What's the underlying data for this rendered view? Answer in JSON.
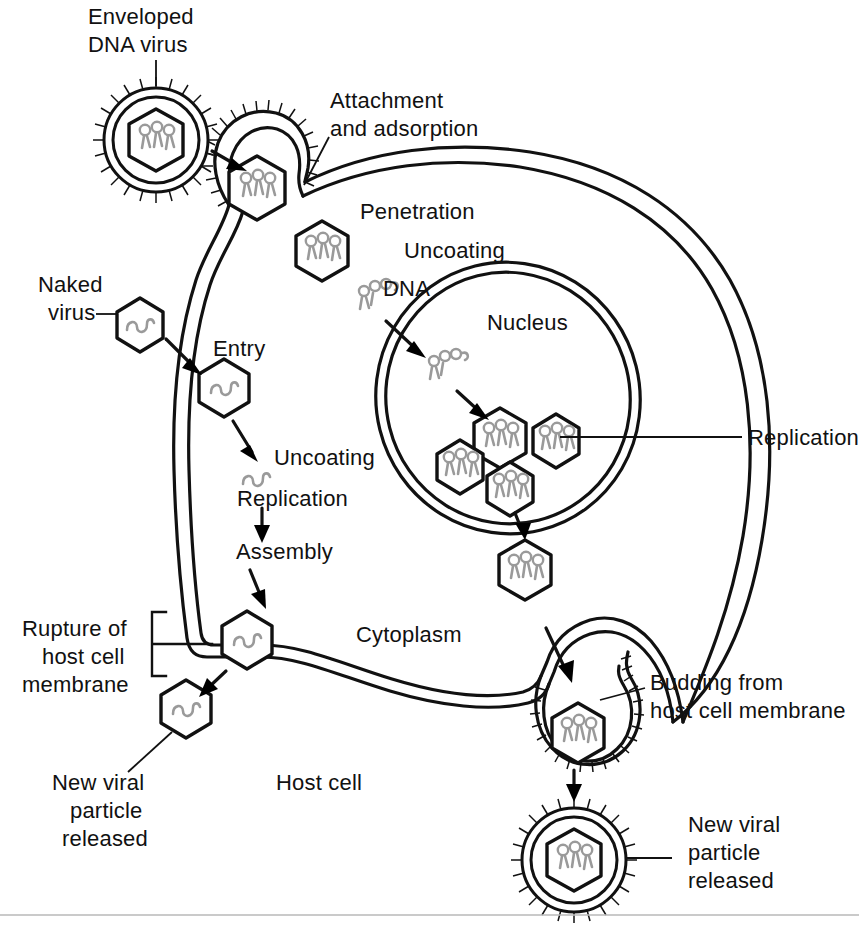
{
  "figure": {
    "background_color": "#ffffff",
    "ink_color": "#111111",
    "nucleic_acid_color": "#9a9a9a",
    "footer_rule_color": "#b8b8b8"
  },
  "labels": {
    "enveloped_virus_line1": "Enveloped",
    "enveloped_virus_line2": "DNA virus",
    "attachment_line1": "Attachment",
    "attachment_line2": "and adsorption",
    "penetration": "Penetration",
    "uncoating_top": "Uncoating",
    "dna": "DNA",
    "nucleus": "Nucleus",
    "replication_right": "Replication",
    "naked_virus_line1": "Naked",
    "naked_virus_line2": "virus",
    "entry": "Entry",
    "uncoating_left": "Uncoating",
    "replication_left": "Replication",
    "assembly": "Assembly",
    "rupture_line1": "Rupture of",
    "rupture_line2": "host cell",
    "rupture_line3": "membrane",
    "new_viral_left_line1": "New viral",
    "new_viral_left_line2": "particle",
    "new_viral_left_line3": "released",
    "cytoplasm": "Cytoplasm",
    "host_cell": "Host cell",
    "budding_line1": "Budding from",
    "budding_line2": "host cell membrane",
    "new_viral_right_line1": "New viral",
    "new_viral_right_line2": "particle",
    "new_viral_right_line3": "released"
  },
  "icons": {
    "enveloped_virion": "enveloped-virion-icon",
    "naked_virion": "naked-virion-icon",
    "dna_strand": "dna-strand-icon",
    "rna_squiggle": "rna-squiggle-icon",
    "arrow": "arrow-icon",
    "bracket": "bracket-icon",
    "leader_line": "leader-line-icon"
  },
  "diagram_elements": {
    "enveloped_virions": [
      {
        "name": "free-enveloped-virus",
        "cx": 156,
        "cy": 140,
        "r": 52
      },
      {
        "name": "released-enveloped-virus",
        "cx": 574,
        "cy": 860,
        "r": 52
      }
    ],
    "naked_capsids": [
      {
        "name": "naked-virus-free",
        "cx": 140,
        "cy": 325
      },
      {
        "name": "naked-virus-entered",
        "cx": 224,
        "cy": 388
      },
      {
        "name": "naked-virus-assembled",
        "cx": 247,
        "cy": 640
      },
      {
        "name": "naked-virus-released",
        "cx": 186,
        "cy": 709
      }
    ],
    "dna_capsids": [
      {
        "name": "capsid-attachment",
        "cx": 251,
        "cy": 188
      },
      {
        "name": "capsid-penetrated",
        "cx": 322,
        "cy": 251
      },
      {
        "name": "capsid-nucleus-1",
        "cx": 497,
        "cy": 439
      },
      {
        "name": "capsid-nucleus-2",
        "cx": 552,
        "cy": 441
      },
      {
        "name": "capsid-nucleus-3",
        "cx": 461,
        "cy": 466
      },
      {
        "name": "capsid-nucleus-4",
        "cx": 508,
        "cy": 488
      },
      {
        "name": "capsid-cytoplasm",
        "cx": 525,
        "cy": 570
      },
      {
        "name": "capsid-budding",
        "cx": 575,
        "cy": 735
      }
    ],
    "process_steps": [
      "Attachment and adsorption",
      "Penetration",
      "Uncoating",
      "Replication",
      "Assembly",
      "Budding from host cell membrane",
      "Rupture of host cell membrane"
    ]
  }
}
